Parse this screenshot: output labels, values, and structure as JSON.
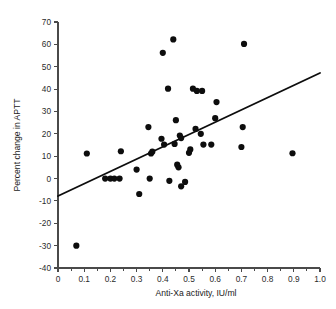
{
  "chart_data": {
    "type": "scatter",
    "title": "",
    "subtitle": "",
    "xlabel": "Anti-Xa activity, IU/ml",
    "ylabel": "Percent change in APTT",
    "xlim": [
      0,
      1.0
    ],
    "ylim": [
      -40,
      70
    ],
    "grid": false,
    "legend": null,
    "x_ticks": [
      0,
      0.1,
      0.2,
      0.3,
      0.4,
      0.5,
      0.6,
      0.7,
      0.8,
      0.9,
      1.0
    ],
    "x_tick_labels": [
      "0",
      "0.1",
      "0.2",
      "0.3",
      "0.4",
      "0.5",
      "0.6",
      "0.7",
      "0.8",
      "0.9",
      "1.0"
    ],
    "x_minor_ticks": [
      0.05,
      0.15,
      0.25,
      0.35,
      0.45,
      0.55,
      0.65,
      0.75,
      0.85,
      0.95
    ],
    "y_ticks": [
      -40,
      -30,
      -20,
      -10,
      0,
      10,
      20,
      30,
      40,
      50,
      60,
      70
    ],
    "y_tick_labels": [
      "-40",
      "-30",
      "-20",
      "-10",
      "0",
      "10",
      "20",
      "30",
      "40",
      "50",
      "60",
      "70"
    ],
    "marker": "filled-circle",
    "marker_color": "#0d0d0d",
    "marker_size": 3.1,
    "points": [
      {
        "x": 0.07,
        "y": -30.0
      },
      {
        "x": 0.11,
        "y": 11.2
      },
      {
        "x": 0.18,
        "y": 0.0
      },
      {
        "x": 0.2,
        "y": 0.0
      },
      {
        "x": 0.215,
        "y": 0.0
      },
      {
        "x": 0.235,
        "y": 0.0
      },
      {
        "x": 0.24,
        "y": 12.2
      },
      {
        "x": 0.3,
        "y": 4.0
      },
      {
        "x": 0.31,
        "y": -6.9
      },
      {
        "x": 0.345,
        "y": 23.0
      },
      {
        "x": 0.35,
        "y": 0.0
      },
      {
        "x": 0.355,
        "y": 11.2
      },
      {
        "x": 0.36,
        "y": 12.0
      },
      {
        "x": 0.395,
        "y": 17.8
      },
      {
        "x": 0.4,
        "y": 56.2
      },
      {
        "x": 0.405,
        "y": 15.2
      },
      {
        "x": 0.42,
        "y": 40.2
      },
      {
        "x": 0.425,
        "y": -1.0
      },
      {
        "x": 0.44,
        "y": 62.2
      },
      {
        "x": 0.445,
        "y": 15.5
      },
      {
        "x": 0.45,
        "y": 26.1
      },
      {
        "x": 0.455,
        "y": 6.2
      },
      {
        "x": 0.46,
        "y": 5.0
      },
      {
        "x": 0.465,
        "y": 19.2
      },
      {
        "x": 0.47,
        "y": 18.1
      },
      {
        "x": 0.47,
        "y": -3.5
      },
      {
        "x": 0.485,
        "y": -1.5
      },
      {
        "x": 0.5,
        "y": 11.5
      },
      {
        "x": 0.505,
        "y": 13.0
      },
      {
        "x": 0.515,
        "y": 40.2
      },
      {
        "x": 0.525,
        "y": 22.2
      },
      {
        "x": 0.53,
        "y": 39.2
      },
      {
        "x": 0.545,
        "y": 20.0
      },
      {
        "x": 0.55,
        "y": 39.2
      },
      {
        "x": 0.555,
        "y": 15.2
      },
      {
        "x": 0.585,
        "y": 15.2
      },
      {
        "x": 0.6,
        "y": 27.0
      },
      {
        "x": 0.605,
        "y": 34.2
      },
      {
        "x": 0.7,
        "y": 14.1
      },
      {
        "x": 0.705,
        "y": 23.0
      },
      {
        "x": 0.71,
        "y": 60.2
      },
      {
        "x": 0.895,
        "y": 11.3
      }
    ],
    "fit_line": {
      "type": "linear-regression",
      "x_start": 0.0,
      "y_start": -7.8,
      "x_end": 1.0,
      "y_end": 47.2,
      "color": "#0d0d0d"
    }
  }
}
